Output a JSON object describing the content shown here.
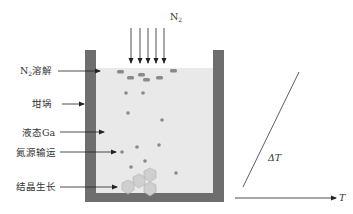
{
  "diagram": {
    "gas_label": "N",
    "gas_label_sub": "2",
    "labels": [
      {
        "id": "n2-dissolve",
        "text": "N",
        "sub": "2",
        "rest": "溶解"
      },
      {
        "id": "crucible",
        "text": "坩埚"
      },
      {
        "id": "liquid-ga",
        "text": "液态Ga"
      },
      {
        "id": "nitrogen-transport",
        "text": "氮源输运"
      },
      {
        "id": "crystal-growth",
        "text": "结晶生长"
      }
    ],
    "gradient_label": "ΔT",
    "axis_label": "T",
    "colors": {
      "wall": "#6e6e6e",
      "liquid": "#e9e9e9",
      "particle": "#8a8a8a",
      "crystal": "#cfcfcf",
      "crystal_edge": "#b0b0b0",
      "line": "#333333"
    }
  }
}
